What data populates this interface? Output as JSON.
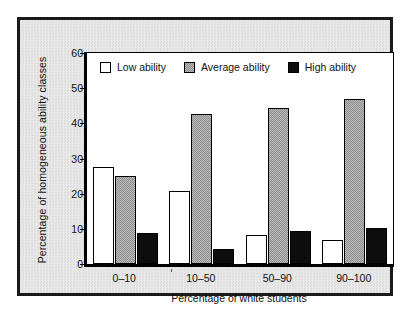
{
  "chart_data": {
    "type": "bar",
    "title": "",
    "xlabel": "Percentage of white students",
    "ylabel": "Percentage of homogeneous ability classes",
    "categories": [
      "0–10",
      "10–50",
      "50–90",
      "90–100"
    ],
    "series": [
      {
        "name": "Low ability",
        "color": "#ffffff",
        "values": [
          27.6,
          20.8,
          8.3,
          6.8
        ]
      },
      {
        "name": "Average ability",
        "color": "#a0a0a0",
        "values": [
          25.1,
          42.8,
          44.5,
          46.8
        ]
      },
      {
        "name": "High ability",
        "color": "#0d0d0d",
        "values": [
          8.7,
          4.4,
          9.4,
          10.3
        ]
      }
    ],
    "ylim": [
      0,
      60
    ],
    "yticks": [
      0,
      10,
      20,
      30,
      40,
      50,
      60
    ],
    "ytick_labels": [
      "0",
      "10",
      "20",
      "30",
      "40",
      "50",
      "60"
    ],
    "grid": false,
    "legend_position": "top-inside"
  },
  "legend": {
    "entries": [
      {
        "label": "Low ability",
        "swatch": "white-square-swatch"
      },
      {
        "label": "Average ability",
        "swatch": "gray-square-swatch"
      },
      {
        "label": "High ability",
        "swatch": "black-square-swatch"
      }
    ]
  },
  "axes": {
    "y_title": "Percentage of homogeneous ability classes",
    "x_title": "Percentage of white students"
  }
}
